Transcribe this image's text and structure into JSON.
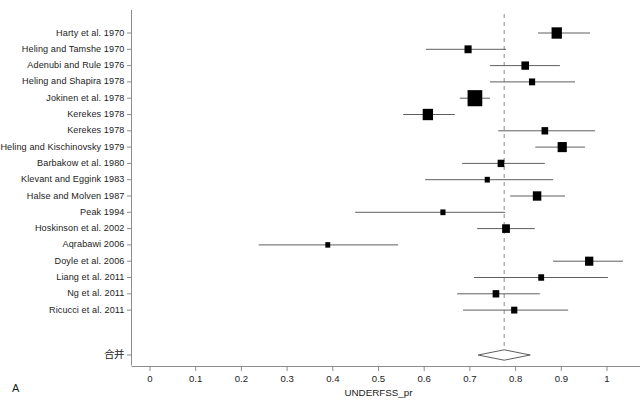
{
  "figure": {
    "panel_letter": "A",
    "xlabel": "UNDERFSS_pr",
    "summary_label": "合并"
  },
  "axis": {
    "ticks": [
      "0",
      "0.1",
      "0.2",
      "0.3",
      "0.4",
      "0.5",
      "0.6",
      "0.7",
      "0.8",
      "0.9",
      "1"
    ]
  },
  "chart_data": {
    "type": "forest",
    "title": "",
    "xlabel": "UNDERFSS_pr",
    "ylabel": "",
    "xlim": [
      0,
      1
    ],
    "xticks": [
      0,
      0.1,
      0.2,
      0.3,
      0.4,
      0.5,
      0.6,
      0.7,
      0.8,
      0.9,
      1
    ],
    "grid": false,
    "reference_line": 0.775,
    "categories": [
      "Harty et al. 1970",
      "Heling and Tamshe 1970",
      "Adenubi and Rule 1976",
      "Heling and Shapira 1978",
      "Jokinen et al. 1978",
      "Kerekes 1978",
      "Kerekes 1978",
      "Heling and Kischinovsky 1979",
      "Barbakow et al. 1980",
      "Klevant and Eggink 1983",
      "Halse and Molven 1987",
      "Peak 1994",
      "Hoskinson et al. 2002",
      "Aqrabawi 2006",
      "Doyle et al. 2006",
      "Liang et al. 2011",
      "Ng et al. 2011",
      "Ricucci et al. 2011"
    ],
    "studies": [
      {
        "label": "Harty et al. 1970",
        "estimate": 0.89,
        "ci_low": 0.849,
        "ci_high": 0.963,
        "weight": 0.62
      },
      {
        "label": "Heling and Tamshe 1970",
        "estimate": 0.696,
        "ci_low": 0.604,
        "ci_high": 0.779,
        "weight": 0.34
      },
      {
        "label": "Adenubi and Rule 1976",
        "estimate": 0.821,
        "ci_low": 0.744,
        "ci_high": 0.897,
        "weight": 0.38
      },
      {
        "label": "Heling and Shapira 1978",
        "estimate": 0.836,
        "ci_low": 0.744,
        "ci_high": 0.93,
        "weight": 0.26
      },
      {
        "label": "Jokinen et al. 1978",
        "estimate": 0.711,
        "ci_low": 0.678,
        "ci_high": 0.744,
        "weight": 1.0
      },
      {
        "label": "Kerekes 1978",
        "estimate": 0.608,
        "ci_low": 0.554,
        "ci_high": 0.667,
        "weight": 0.62
      },
      {
        "label": "Kerekes 1978",
        "estimate": 0.864,
        "ci_low": 0.762,
        "ci_high": 0.974,
        "weight": 0.3
      },
      {
        "label": "Heling and Kischinovsky 1979",
        "estimate": 0.902,
        "ci_low": 0.843,
        "ci_high": 0.952,
        "weight": 0.52
      },
      {
        "label": "Barbakow et al. 1980",
        "estimate": 0.768,
        "ci_low": 0.683,
        "ci_high": 0.864,
        "weight": 0.3
      },
      {
        "label": "Klevant and Eggink 1983",
        "estimate": 0.738,
        "ci_low": 0.602,
        "ci_high": 0.882,
        "weight": 0.17
      },
      {
        "label": "Halse and Molven 1987",
        "estimate": 0.847,
        "ci_low": 0.788,
        "ci_high": 0.908,
        "weight": 0.46
      },
      {
        "label": "Peak 1994",
        "estimate": 0.641,
        "ci_low": 0.449,
        "ci_high": 0.777,
        "weight": 0.17
      },
      {
        "label": "Hoskinson et al. 2002",
        "estimate": 0.779,
        "ci_low": 0.716,
        "ci_high": 0.842,
        "weight": 0.4
      },
      {
        "label": "Aqrabawi 2006",
        "estimate": 0.389,
        "ci_low": 0.238,
        "ci_high": 0.543,
        "weight": 0.15
      },
      {
        "label": "Doyle et al. 2006",
        "estimate": 0.961,
        "ci_low": 0.882,
        "ci_high": 1.035,
        "weight": 0.44
      },
      {
        "label": "Liang et al. 2011",
        "estimate": 0.856,
        "ci_low": 0.709,
        "ci_high": 1.002,
        "weight": 0.23
      },
      {
        "label": "Ng et al. 2011",
        "estimate": 0.757,
        "ci_low": 0.672,
        "ci_high": 0.853,
        "weight": 0.3
      },
      {
        "label": "Ricucci et al. 2011",
        "estimate": 0.797,
        "ci_low": 0.685,
        "ci_high": 0.915,
        "weight": 0.26
      }
    ],
    "summary": {
      "label": "合并",
      "estimate": 0.775,
      "ci_low": 0.718,
      "ci_high": 0.832
    }
  },
  "colors": {
    "marker": "#000000",
    "axis": "#808080",
    "reference_line": "#8c8c8c",
    "text": "#1c1c1c"
  }
}
